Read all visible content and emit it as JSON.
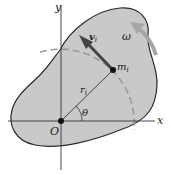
{
  "diagram": {
    "type": "rigid-body-rotation",
    "colors": {
      "body_fill": "#c9c9c9",
      "body_stroke": "#2a2a2a",
      "axis": "#333333",
      "arc": "#9a9a9a",
      "velocity_arrow": "#444444",
      "omega_arrow": "#a6a6a6"
    },
    "labels": {
      "y_axis": "y",
      "x_axis": "x",
      "origin": "O",
      "mass": "m",
      "mass_sub": "i",
      "radius": "r",
      "radius_sub": "i",
      "angle": "θ",
      "velocity": "v",
      "velocity_sub": "i",
      "angular_velocity": "ω"
    }
  }
}
